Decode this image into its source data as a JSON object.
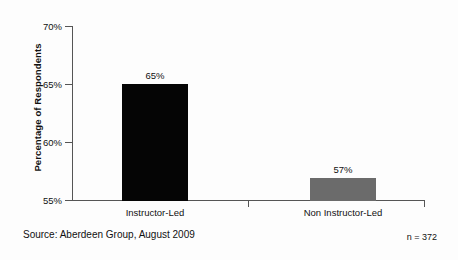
{
  "chart_data": {
    "type": "bar",
    "title": "",
    "subtitle": "",
    "xlabel": "",
    "ylabel": "Percentage of Respondents",
    "categories": [
      "Instructor-Led",
      "Non Instructor-Led"
    ],
    "values": [
      65,
      57
    ],
    "value_labels": [
      "65%",
      "57%"
    ],
    "ylim": [
      55,
      70
    ],
    "yticks": [
      70,
      65,
      60,
      55
    ],
    "ytick_labels": [
      "70%",
      "65%",
      "60%",
      "55%"
    ],
    "grid": false,
    "legend": false,
    "series": [
      {
        "name": "Percentage of Respondents",
        "values": [
          65,
          57
        ],
        "colors": [
          "#050505",
          "#6b6b6b"
        ]
      }
    ],
    "annotations": {
      "source": "Source: Aberdeen Group, August 2009",
      "sample_size": "n = 372"
    }
  },
  "colors": {
    "bar_primary": "#050505",
    "bar_secondary": "#6b6b6b",
    "axis": "#555555",
    "text": "#111111",
    "background": "#fdfdfd"
  }
}
